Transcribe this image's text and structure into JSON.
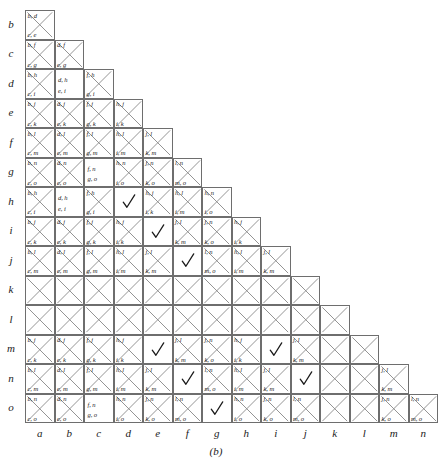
{
  "figure": {
    "caption": "(b)",
    "type": "pairwise-comparison-matrix",
    "row_labels": [
      "b",
      "c",
      "d",
      "e",
      "f",
      "g",
      "h",
      "i",
      "j",
      "k",
      "l",
      "m",
      "n",
      "o"
    ],
    "col_labels": [
      "a",
      "b",
      "c",
      "d",
      "e",
      "f",
      "g",
      "h",
      "i",
      "j",
      "k",
      "l",
      "m",
      "n"
    ],
    "grid": {
      "origin_x": 25,
      "origin_y": 10,
      "cell": 29.5,
      "border_color": "#6e6e6e",
      "x_color": "#8a8a8a",
      "check_color": "#1a1a1a"
    },
    "rows": [
      {
        "label": "b",
        "cells": [
          {
            "col": "a",
            "mark": "x",
            "tl": "b, d",
            "bl": "c, e"
          }
        ]
      },
      {
        "label": "c",
        "cells": [
          {
            "col": "a",
            "mark": "x",
            "tl": "b, f",
            "bl": "c, g"
          },
          {
            "col": "b",
            "mark": "x",
            "tl": "d, f",
            "bl": "e, g"
          }
        ]
      },
      {
        "label": "d",
        "cells": [
          {
            "col": "a",
            "mark": "x",
            "tl": "b, h",
            "bl": "c, i"
          },
          {
            "col": "b",
            "mark": "text",
            "top": "d, h",
            "bottom": "e, i"
          },
          {
            "col": "c",
            "mark": "x",
            "tl": "f, h",
            "bl": "g, i"
          }
        ]
      },
      {
        "label": "e",
        "cells": [
          {
            "col": "a",
            "mark": "x",
            "tl": "b, j",
            "bl": "c, k"
          },
          {
            "col": "b",
            "mark": "x",
            "tl": "d, j",
            "bl": "e, k"
          },
          {
            "col": "c",
            "mark": "x",
            "tl": "f, j",
            "bl": "g, k"
          },
          {
            "col": "d",
            "mark": "x",
            "tl": "h, j",
            "bl": "i, k"
          }
        ]
      },
      {
        "label": "f",
        "cells": [
          {
            "col": "a",
            "mark": "x",
            "tl": "b, l",
            "bl": "c, m"
          },
          {
            "col": "b",
            "mark": "x",
            "tl": "d, l",
            "bl": "e, m"
          },
          {
            "col": "c",
            "mark": "x",
            "tl": "f, l",
            "bl": "g, m"
          },
          {
            "col": "d",
            "mark": "x",
            "tl": "h, l",
            "bl": "i, m"
          },
          {
            "col": "e",
            "mark": "x",
            "tl": "j, l",
            "bl": "k, m"
          }
        ]
      },
      {
        "label": "g",
        "cells": [
          {
            "col": "a",
            "mark": "x",
            "tl": "b, n",
            "bl": "c, o"
          },
          {
            "col": "b",
            "mark": "x",
            "tl": "d, n",
            "bl": "e, o"
          },
          {
            "col": "c",
            "mark": "text",
            "top": "f, n",
            "bottom": "g, o"
          },
          {
            "col": "d",
            "mark": "x",
            "tl": "h, n",
            "bl": "i, o"
          },
          {
            "col": "e",
            "mark": "x",
            "tl": "j, n",
            "bl": "k, o"
          },
          {
            "col": "f",
            "mark": "x",
            "tl": "l, n",
            "bl": "m, o"
          }
        ]
      },
      {
        "label": "h",
        "cells": [
          {
            "col": "a",
            "mark": "x",
            "tl": "b, h",
            "bl": "c, i"
          },
          {
            "col": "b",
            "mark": "text",
            "top": "d, h",
            "bottom": "e, i"
          },
          {
            "col": "c",
            "mark": "x",
            "tl": "f, h",
            "bl": "g, i"
          },
          {
            "col": "d",
            "mark": "check"
          },
          {
            "col": "e",
            "mark": "x",
            "tl": "h, j",
            "bl": "i, k"
          },
          {
            "col": "f",
            "mark": "x",
            "tl": "h, l",
            "bl": "i, m"
          },
          {
            "col": "g",
            "mark": "x",
            "tl": "h, n",
            "bl": "i, o"
          }
        ]
      },
      {
        "label": "i",
        "cells": [
          {
            "col": "a",
            "mark": "x",
            "tl": "b, j",
            "bl": "c, k"
          },
          {
            "col": "b",
            "mark": "x",
            "tl": "d, j",
            "bl": "e, k"
          },
          {
            "col": "c",
            "mark": "x",
            "tl": "f, j",
            "bl": "g, k"
          },
          {
            "col": "d",
            "mark": "x",
            "tl": "h, j",
            "bl": "i, k"
          },
          {
            "col": "e",
            "mark": "check"
          },
          {
            "col": "f",
            "mark": "x",
            "tl": "j, l",
            "bl": "k, m"
          },
          {
            "col": "g",
            "mark": "x",
            "tl": "j, n",
            "bl": "k, o"
          },
          {
            "col": "h",
            "mark": "x",
            "tl": "h, j",
            "bl": "i, k"
          }
        ]
      },
      {
        "label": "j",
        "cells": [
          {
            "col": "a",
            "mark": "x",
            "tl": "b, l",
            "bl": "c, m"
          },
          {
            "col": "b",
            "mark": "x",
            "tl": "d, l",
            "bl": "e, m"
          },
          {
            "col": "c",
            "mark": "x",
            "tl": "f, l",
            "bl": "g, m"
          },
          {
            "col": "d",
            "mark": "x",
            "tl": "h, l",
            "bl": "i, m"
          },
          {
            "col": "e",
            "mark": "x",
            "tl": "j, l",
            "bl": "k, m"
          },
          {
            "col": "f",
            "mark": "check"
          },
          {
            "col": "g",
            "mark": "x",
            "tl": "l, n",
            "bl": "m, o"
          },
          {
            "col": "h",
            "mark": "x",
            "tl": "h, l",
            "bl": "i, m"
          },
          {
            "col": "i",
            "mark": "x",
            "tl": "j, l",
            "bl": "k, m"
          }
        ]
      },
      {
        "label": "k",
        "cells": [
          {
            "col": "a",
            "mark": "x"
          },
          {
            "col": "b",
            "mark": "x"
          },
          {
            "col": "c",
            "mark": "x"
          },
          {
            "col": "d",
            "mark": "x"
          },
          {
            "col": "e",
            "mark": "x"
          },
          {
            "col": "f",
            "mark": "x"
          },
          {
            "col": "g",
            "mark": "x"
          },
          {
            "col": "h",
            "mark": "x"
          },
          {
            "col": "i",
            "mark": "x"
          },
          {
            "col": "j",
            "mark": "x"
          }
        ]
      },
      {
        "label": "l",
        "cells": [
          {
            "col": "a",
            "mark": "x"
          },
          {
            "col": "b",
            "mark": "x"
          },
          {
            "col": "c",
            "mark": "x"
          },
          {
            "col": "d",
            "mark": "x"
          },
          {
            "col": "e",
            "mark": "x"
          },
          {
            "col": "f",
            "mark": "x"
          },
          {
            "col": "g",
            "mark": "x"
          },
          {
            "col": "h",
            "mark": "x"
          },
          {
            "col": "i",
            "mark": "x"
          },
          {
            "col": "j",
            "mark": "x"
          },
          {
            "col": "k",
            "mark": "x"
          }
        ]
      },
      {
        "label": "m",
        "cells": [
          {
            "col": "a",
            "mark": "x",
            "tl": "b, j",
            "bl": "c, k"
          },
          {
            "col": "b",
            "mark": "x",
            "tl": "d, j",
            "bl": "e, k"
          },
          {
            "col": "c",
            "mark": "x",
            "tl": "f, j",
            "bl": "g, k"
          },
          {
            "col": "d",
            "mark": "x",
            "tl": "h, j",
            "bl": "i, k"
          },
          {
            "col": "e",
            "mark": "check"
          },
          {
            "col": "f",
            "mark": "x",
            "tl": "j, l",
            "bl": "k, m"
          },
          {
            "col": "g",
            "mark": "x",
            "tl": "j, n",
            "bl": "k, o"
          },
          {
            "col": "h",
            "mark": "x",
            "tl": "h, j",
            "bl": "i, k"
          },
          {
            "col": "i",
            "mark": "check"
          },
          {
            "col": "j",
            "mark": "x",
            "tl": "j, l",
            "bl": "k, m"
          },
          {
            "col": "k",
            "mark": "x"
          },
          {
            "col": "l",
            "mark": "x"
          }
        ]
      },
      {
        "label": "n",
        "cells": [
          {
            "col": "a",
            "mark": "x",
            "tl": "b, l",
            "bl": "c, m"
          },
          {
            "col": "b",
            "mark": "x",
            "tl": "d, l",
            "bl": "e, m"
          },
          {
            "col": "c",
            "mark": "x",
            "tl": "f, l",
            "bl": "g, m"
          },
          {
            "col": "d",
            "mark": "x",
            "tl": "h, l",
            "bl": "i, m"
          },
          {
            "col": "e",
            "mark": "x",
            "tl": "j, l",
            "bl": "k, m"
          },
          {
            "col": "f",
            "mark": "check"
          },
          {
            "col": "g",
            "mark": "x",
            "tl": "l, n",
            "bl": "m, o"
          },
          {
            "col": "h",
            "mark": "x",
            "tl": "h, l",
            "bl": "i, m"
          },
          {
            "col": "i",
            "mark": "x",
            "tl": "j, l",
            "bl": "k, m"
          },
          {
            "col": "j",
            "mark": "check"
          },
          {
            "col": "k",
            "mark": "x"
          },
          {
            "col": "l",
            "mark": "x"
          },
          {
            "col": "m",
            "mark": "x",
            "tl": "j, l",
            "bl": "k, m"
          }
        ]
      },
      {
        "label": "o",
        "cells": [
          {
            "col": "a",
            "mark": "x",
            "tl": "b, n",
            "bl": "c, o"
          },
          {
            "col": "b",
            "mark": "x",
            "tl": "d, n",
            "bl": "e, o"
          },
          {
            "col": "c",
            "mark": "text",
            "top": "f, n",
            "bottom": "g, o"
          },
          {
            "col": "d",
            "mark": "x",
            "tl": "h, n",
            "bl": "i, o"
          },
          {
            "col": "e",
            "mark": "x",
            "tl": "j, n",
            "bl": "k, o"
          },
          {
            "col": "f",
            "mark": "x",
            "tl": "l, n",
            "bl": "m, o"
          },
          {
            "col": "g",
            "mark": "check"
          },
          {
            "col": "h",
            "mark": "x",
            "tl": "h, n",
            "bl": "i, o"
          },
          {
            "col": "i",
            "mark": "x",
            "tl": "j, n",
            "bl": "k, o"
          },
          {
            "col": "j",
            "mark": "x",
            "tl": "l, n",
            "bl": "m, o"
          },
          {
            "col": "k",
            "mark": "x"
          },
          {
            "col": "l",
            "mark": "x"
          },
          {
            "col": "m",
            "mark": "x",
            "tl": "j, n",
            "bl": "k, o"
          },
          {
            "col": "n",
            "mark": "x",
            "tl": "l, n",
            "bl": "m, o"
          }
        ]
      }
    ]
  }
}
